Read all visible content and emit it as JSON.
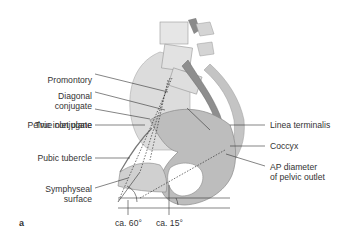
{
  "figure": {
    "panel_letter": "a",
    "labels_left": [
      {
        "id": "promontory",
        "text": "Promontory"
      },
      {
        "id": "diagonal_1",
        "text": "Diagonal"
      },
      {
        "id": "diagonal_2",
        "text": "conjugate"
      },
      {
        "id": "true_conjugate",
        "text": "True conjugate"
      },
      {
        "id": "pelvic_inlet",
        "text": "Pelvic inlet plane"
      },
      {
        "id": "pubic_tubercle",
        "text": "Pubic tubercle"
      },
      {
        "id": "symphyseal_1",
        "text": "Symphyseal"
      },
      {
        "id": "symphyseal_2",
        "text": "surface"
      }
    ],
    "labels_right": [
      {
        "id": "linea",
        "text": "Linea terminalis"
      },
      {
        "id": "coccyx",
        "text": "Coccyx"
      },
      {
        "id": "ap_1",
        "text": "AP diameter"
      },
      {
        "id": "ap_2",
        "text": "of pelvic outlet"
      }
    ],
    "angles": [
      {
        "id": "angle60",
        "text": "ca. 60°"
      },
      {
        "id": "angle15",
        "text": "ca. 15°"
      }
    ],
    "colors": {
      "bone_light": "#e4e4e4",
      "bone_mid": "#c8c8c8",
      "bone_dark": "#9a9a9a",
      "line": "#333333"
    }
  }
}
